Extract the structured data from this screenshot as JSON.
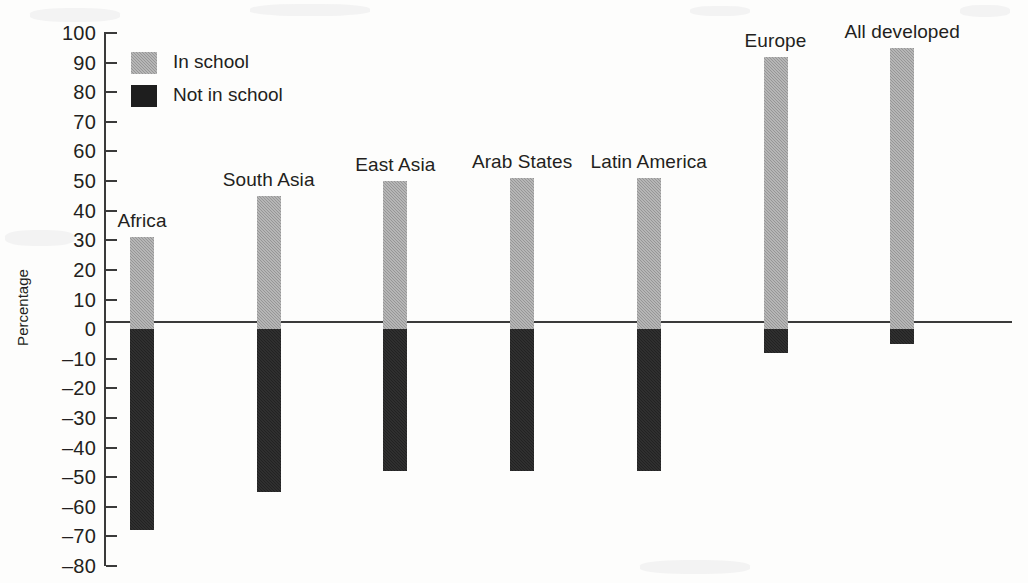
{
  "chart_data": {
    "type": "bar",
    "title": "",
    "subtitle": "",
    "xlabel": "",
    "ylabel": "Percentage",
    "ylim": [
      -80,
      100
    ],
    "ytick_step": 10,
    "grid": false,
    "orientation": "vertical",
    "stacked_diverging": true,
    "legend_position": "top-left",
    "categories": [
      "Africa",
      "South Asia",
      "East Asia",
      "Arab States",
      "Latin America",
      "Europe",
      "All developed"
    ],
    "series": [
      {
        "name": "In school",
        "color": "#969696",
        "values": [
          31,
          45,
          50,
          51,
          51,
          92,
          95
        ]
      },
      {
        "name": "Not in school",
        "color": "#1e1e1e",
        "values": [
          -68,
          -55,
          -48,
          -48,
          -48,
          -8,
          -5
        ]
      }
    ],
    "ytick_labels": [
      "100",
      "90",
      "80",
      "70",
      "60",
      "50",
      "40",
      "30",
      "20",
      "10",
      "0",
      "-10",
      "-20",
      "-30",
      "-40",
      "-50",
      "-60",
      "-70",
      "-80"
    ],
    "ytick_values": [
      100,
      90,
      80,
      70,
      60,
      50,
      40,
      30,
      20,
      10,
      0,
      -10,
      -20,
      -30,
      -40,
      -50,
      -60,
      -70,
      -80
    ]
  },
  "legend": {
    "items": [
      {
        "label": "In school",
        "swatch": "in-school",
        "color": "#969696"
      },
      {
        "label": "Not in school",
        "swatch": "not-in-school",
        "color": "#1e1e1e"
      }
    ]
  },
  "axis": {
    "y_title": "Percentage"
  }
}
